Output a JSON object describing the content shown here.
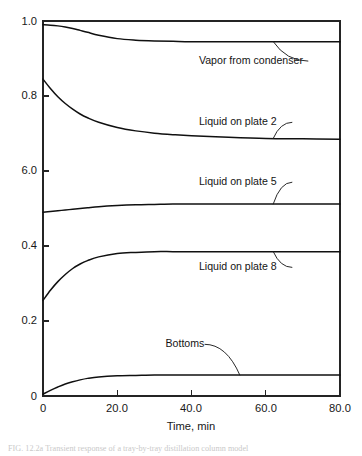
{
  "figure": {
    "caption": "FIG. 12.2a  Transient response of a tray-by-tray distillation column model"
  },
  "chart_data": {
    "type": "line",
    "title": "",
    "xlabel": "Time, min",
    "ylabel": "",
    "xlim": [
      0,
      80
    ],
    "ylim": [
      0,
      1.0
    ],
    "grid": false,
    "legend_position": "inline-annotations",
    "x_ticks": [
      0,
      20,
      40,
      60,
      80
    ],
    "x_ticklabels": [
      "0",
      "20.0",
      "40.0",
      "60.0",
      "80.0"
    ],
    "y_ticks": [
      0,
      0.2,
      0.4,
      0.6,
      0.8,
      1.0
    ],
    "y_ticklabels": [
      "0",
      "0.2",
      "0.4",
      "6.0",
      "0.8",
      "1.0"
    ],
    "y_ticklabel_note": "The 0.6 tick is printed as '6.0' in the original figure.",
    "x": [
      0,
      2,
      4,
      6,
      8,
      10,
      12,
      15,
      20,
      25,
      30,
      35,
      40,
      50,
      60,
      70,
      80
    ],
    "series": [
      {
        "name": "Vapor from condenser",
        "label": "Vapor from condenser",
        "values": [
          0.99,
          0.989,
          0.987,
          0.984,
          0.98,
          0.975,
          0.97,
          0.962,
          0.953,
          0.949,
          0.947,
          0.946,
          0.945,
          0.945,
          0.945,
          0.945,
          0.945
        ],
        "start_value": 0.99,
        "steady_state": 0.945,
        "label_x": 42,
        "label_y": 0.885
      },
      {
        "name": "Liquid on plate 2",
        "label": "Liquid on plate 2",
        "values": [
          0.845,
          0.82,
          0.798,
          0.78,
          0.765,
          0.752,
          0.742,
          0.73,
          0.716,
          0.707,
          0.701,
          0.697,
          0.694,
          0.69,
          0.687,
          0.686,
          0.685
        ],
        "start_value": 0.845,
        "steady_state": 0.685,
        "label_x": 42,
        "label_y": 0.722
      },
      {
        "name": "Liquid on plate 5",
        "label": "Liquid on plate 5",
        "values": [
          0.49,
          0.492,
          0.494,
          0.496,
          0.498,
          0.5,
          0.502,
          0.505,
          0.508,
          0.51,
          0.511,
          0.512,
          0.512,
          0.512,
          0.512,
          0.512,
          0.512
        ],
        "start_value": 0.49,
        "steady_state": 0.512,
        "label_x": 42,
        "label_y": 0.562
      },
      {
        "name": "Liquid on plate 8",
        "label": "Liquid on plate 8",
        "values": [
          0.255,
          0.282,
          0.305,
          0.324,
          0.34,
          0.352,
          0.361,
          0.371,
          0.38,
          0.383,
          0.385,
          0.385,
          0.385,
          0.385,
          0.385,
          0.385,
          0.385
        ],
        "start_value": 0.255,
        "steady_state": 0.385,
        "label_x": 42,
        "label_y": 0.335
      },
      {
        "name": "Bottoms",
        "label": "Bottoms",
        "values": [
          0.005,
          0.015,
          0.024,
          0.032,
          0.038,
          0.043,
          0.047,
          0.051,
          0.054,
          0.055,
          0.056,
          0.056,
          0.056,
          0.056,
          0.056,
          0.056,
          0.056
        ],
        "start_value": 0.005,
        "steady_state": 0.056,
        "label_x": 33,
        "label_y": 0.13
      }
    ]
  }
}
